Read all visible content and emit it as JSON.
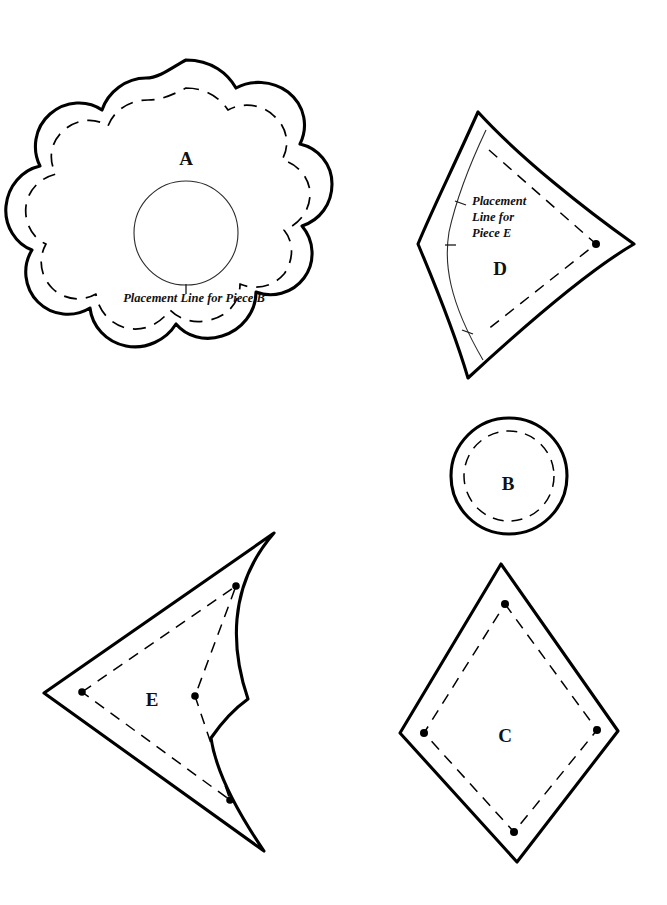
{
  "document": {
    "title": "Sewing Pattern Pieces Sheet",
    "background_color": "#ffffff",
    "line_color": "#000000",
    "width": 667,
    "height": 905
  },
  "pieces": [
    {
      "id": "piece-a",
      "label": "A",
      "shape": "scalloped-flower",
      "label_position": {
        "x": 186,
        "y": 158
      },
      "has_cut_line": true,
      "has_stitch_line": true,
      "has_inner_circle": true,
      "note": {
        "lines": [
          "Placement Line for Piece B"
        ],
        "position": {
          "x": 194,
          "y": 300
        },
        "anchor": "middle"
      }
    },
    {
      "id": "piece-d",
      "label": "D",
      "shape": "kite-quadrilateral",
      "label_position": {
        "x": 500,
        "y": 268
      },
      "has_cut_line": true,
      "has_stitch_line": true,
      "has_guide_line": true,
      "note": {
        "lines": [
          "Placement",
          "Line for",
          "Piece E"
        ],
        "position": {
          "x": 472,
          "y": 208
        },
        "anchor": "start"
      }
    },
    {
      "id": "piece-b",
      "label": "B",
      "shape": "circle",
      "label_position": {
        "x": 508,
        "y": 483
      },
      "has_cut_line": true,
      "has_stitch_line": true
    },
    {
      "id": "piece-e",
      "label": "E",
      "shape": "arrowhead-chevron",
      "label_position": {
        "x": 152,
        "y": 700
      },
      "has_cut_line": true,
      "has_stitch_line": true
    },
    {
      "id": "piece-c",
      "label": "C",
      "shape": "diamond",
      "label_position": {
        "x": 505,
        "y": 735
      },
      "has_cut_line": true,
      "has_stitch_line": true
    }
  ],
  "legend": {
    "cut_line_description": "solid heavy line",
    "stitch_line_description": "dashed line",
    "placement_line_description": "thin solid line"
  }
}
